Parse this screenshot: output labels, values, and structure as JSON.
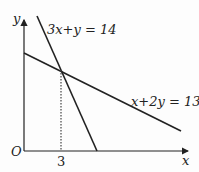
{
  "diagram": {
    "type": "coordinate-graph",
    "axes": {
      "x_label": "x",
      "y_label": "y",
      "origin_label": "O"
    },
    "lines": [
      {
        "equation": "3x+y = 14",
        "label": "3x+y = 14"
      },
      {
        "equation": "x+2y = 13",
        "label": "x+2y = 13"
      }
    ],
    "intersection": {
      "x": 3,
      "y": 5
    },
    "tick_labels": {
      "x": "3"
    },
    "colors": {
      "line": "#222222",
      "background": "#fdfdfd",
      "dotted": "#444444"
    }
  }
}
